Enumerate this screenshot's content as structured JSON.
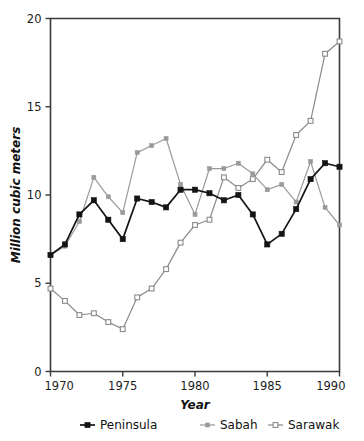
{
  "chart_data": {
    "type": "line",
    "title": "",
    "xlabel": "Year",
    "ylabel": "Million cubic meters",
    "xlim": [
      1970,
      1990
    ],
    "ylim": [
      0,
      20
    ],
    "xticks": [
      1970,
      1975,
      1980,
      1985,
      1990
    ],
    "yticks": [
      0,
      5,
      10,
      15,
      20
    ],
    "grid": false,
    "legend_position": "below",
    "x": [
      1970,
      1971,
      1972,
      1973,
      1974,
      1975,
      1976,
      1977,
      1978,
      1979,
      1980,
      1981,
      1982,
      1983,
      1984,
      1985,
      1986,
      1987,
      1988,
      1989,
      1990
    ],
    "series": [
      {
        "name": "Peninsula",
        "color": "#141414",
        "marker": "filled-square",
        "values": [
          6.6,
          7.2,
          8.9,
          9.7,
          8.6,
          7.5,
          9.8,
          9.6,
          9.3,
          10.3,
          10.3,
          10.1,
          9.7,
          10.0,
          8.9,
          7.2,
          7.8,
          9.2,
          10.9,
          11.8,
          11.6
        ]
      },
      {
        "name": "Sabah",
        "color": "#9a9a9a",
        "marker": "filled-square-small",
        "values": [
          6.6,
          7.1,
          8.5,
          11.0,
          9.9,
          9.0,
          12.4,
          12.8,
          13.2,
          10.6,
          8.9,
          11.5,
          11.5,
          11.8,
          11.2,
          10.3,
          10.6,
          9.6,
          11.9,
          9.3,
          8.3
        ]
      },
      {
        "name": "Sarawak",
        "color": "#8a8a8a",
        "marker": "open-square",
        "values": [
          4.7,
          4.0,
          3.2,
          3.3,
          2.8,
          2.4,
          4.2,
          4.7,
          5.8,
          7.3,
          8.3,
          8.6,
          11.0,
          10.4,
          10.9,
          12.0,
          11.3,
          13.4,
          14.2,
          18.0,
          18.7
        ]
      }
    ],
    "legend": [
      {
        "label": "Peninsula",
        "color": "#141414",
        "marker": "filled-square"
      },
      {
        "label": "Sabah",
        "color": "#9a9a9a",
        "marker": "filled-square-small"
      },
      {
        "label": "Sarawak",
        "color": "#8a8a8a",
        "marker": "open-square"
      }
    ]
  }
}
